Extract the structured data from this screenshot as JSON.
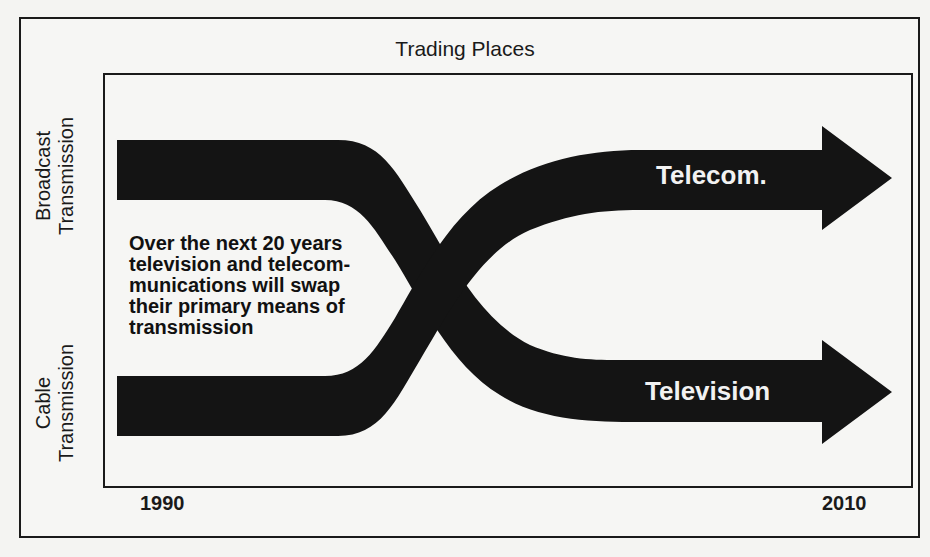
{
  "title": "Trading Places",
  "side_labels": {
    "top": [
      "Broadcast",
      "Transmission"
    ],
    "bottom": [
      "Cable",
      "Transmission"
    ]
  },
  "annotation": [
    "Over the next 20 years",
    "television and telecom-",
    "munications will swap",
    "their primary means of",
    "transmission"
  ],
  "arrows": {
    "top_label": "Telecom.",
    "bottom_label": "Television"
  },
  "timeline": {
    "start": "1990",
    "end": "2010"
  },
  "colors": {
    "band": "#141414",
    "background": "#f6f6f4",
    "label_text": "#f2f2f2"
  },
  "flows": [
    {
      "name": "Television",
      "from": "Broadcast Transmission",
      "to": "Cable Transmission",
      "start_year": "1990",
      "end_year": "2010"
    },
    {
      "name": "Telecom.",
      "from": "Cable Transmission",
      "to": "Broadcast Transmission",
      "start_year": "1990",
      "end_year": "2010"
    }
  ]
}
